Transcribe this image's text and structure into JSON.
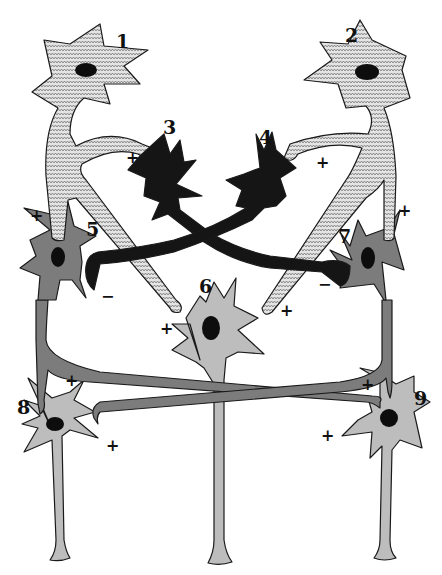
{
  "figure": {
    "type": "neural circuit diagram",
    "colors": {
      "excitatory_pattern_bg": "#e2e2e2",
      "excitatory_pattern_line": "#6a6a6a",
      "inhibitory": "#151515",
      "middle_layer": "#7c7c7c",
      "output_layer": "#bdbdbd",
      "nucleus": "#0d0d0d",
      "outline": "#1a1a1a"
    },
    "neurons": [
      {
        "id": "1",
        "label": "1",
        "fill": "zigzag-pattern"
      },
      {
        "id": "2",
        "label": "2",
        "fill": "zigzag-pattern"
      },
      {
        "id": "3",
        "label": "3",
        "fill": "black"
      },
      {
        "id": "4",
        "label": "4",
        "fill": "black"
      },
      {
        "id": "5",
        "label": "5",
        "fill": "dark-gray"
      },
      {
        "id": "6",
        "label": "6",
        "fill": "light-gray"
      },
      {
        "id": "7",
        "label": "7",
        "fill": "dark-gray"
      },
      {
        "id": "8",
        "label": "8",
        "fill": "light-gray"
      },
      {
        "id": "9",
        "label": "9",
        "fill": "light-gray"
      }
    ],
    "synapses": [
      {
        "from": "1",
        "to": "3",
        "sign": "+"
      },
      {
        "from": "2",
        "to": "4",
        "sign": "+"
      },
      {
        "from": "1",
        "to": "5",
        "sign": "+"
      },
      {
        "from": "2",
        "to": "7",
        "sign": "+"
      },
      {
        "from": "1",
        "to": "6",
        "sign": "+"
      },
      {
        "from": "2",
        "to": "6",
        "sign": "+"
      },
      {
        "from": "3",
        "to": "7",
        "sign": "−"
      },
      {
        "from": "4",
        "to": "5",
        "sign": "−"
      },
      {
        "from": "5",
        "to": "8",
        "sign": "+"
      },
      {
        "from": "5",
        "to": "9",
        "sign": "+"
      },
      {
        "from": "7",
        "to": "9",
        "sign": "+"
      },
      {
        "from": "7",
        "to": "8",
        "sign": "+"
      }
    ]
  }
}
